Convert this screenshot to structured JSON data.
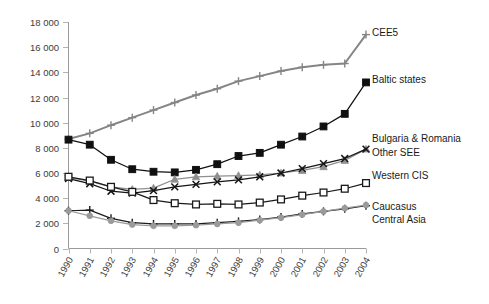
{
  "chart_data": {
    "type": "line",
    "title": "",
    "subtitle": "",
    "xlabel": "",
    "ylabel": "",
    "grid": false,
    "legend_position": "right-inline",
    "x": [
      1990,
      1991,
      1992,
      1993,
      1994,
      1995,
      1996,
      1997,
      1998,
      1999,
      2000,
      2001,
      2002,
      2003,
      2004
    ],
    "categories": [
      "1990",
      "1991",
      "1992",
      "1993",
      "1994",
      "1995",
      "1996",
      "1997",
      "1998",
      "1999",
      "2000",
      "2001",
      "2002",
      "2003",
      "2004"
    ],
    "ylim": [
      0,
      18000
    ],
    "yticks": [
      0,
      2000,
      4000,
      6000,
      8000,
      10000,
      12000,
      14000,
      16000,
      18000
    ],
    "ytick_labels": [
      "0",
      "2 000",
      "4 000",
      "6 000",
      "8 000",
      "10 000",
      "12 000",
      "14 000",
      "16 000",
      "18 000"
    ],
    "series": [
      {
        "name": "CEE5",
        "label": "CEE5",
        "color": "#858585",
        "marker": "plus",
        "values": [
          8700,
          9150,
          9800,
          10400,
          11000,
          11600,
          12200,
          12700,
          13300,
          13700,
          14100,
          14400,
          14600,
          14700,
          17000
        ]
      },
      {
        "name": "Baltic states",
        "label": "Baltic states",
        "color": "#101010",
        "marker": "square-filled",
        "values": [
          8650,
          8250,
          7050,
          6300,
          6100,
          6050,
          6250,
          6700,
          7350,
          7600,
          8250,
          8900,
          9700,
          10700,
          13200
        ]
      },
      {
        "name": "Bulgaria & Romania",
        "label": "Bulgaria & Romania",
        "color": "#8f8f8f",
        "marker": "triangle-filled",
        "values": [
          5650,
          5350,
          4900,
          4700,
          4800,
          5500,
          5700,
          5750,
          5800,
          5850,
          6000,
          6200,
          6500,
          7000,
          7900
        ]
      },
      {
        "name": "Other SEE",
        "label": "Other SEE",
        "color": "#151515",
        "marker": "cross",
        "values": [
          5550,
          5150,
          4550,
          4400,
          4600,
          4900,
          5100,
          5300,
          5450,
          5700,
          6000,
          6350,
          6750,
          7150,
          7900
        ]
      },
      {
        "name": "Western CIS",
        "label": "Western CIS",
        "color": "#1a1a1a",
        "marker": "square-open",
        "values": [
          5700,
          5400,
          4900,
          4500,
          3850,
          3600,
          3500,
          3550,
          3500,
          3650,
          3900,
          4200,
          4450,
          4750,
          5200
        ]
      },
      {
        "name": "Caucasus",
        "label": "Caucasus",
        "color": "#1c1c1c",
        "marker": "plus",
        "values": [
          3000,
          3050,
          2400,
          2050,
          1950,
          1950,
          1950,
          2050,
          2150,
          2300,
          2500,
          2750,
          2950,
          3150,
          3400
        ]
      },
      {
        "name": "Central Asia",
        "label": "Central Asia",
        "color": "#9a9a9a",
        "marker": "circle-filled",
        "values": [
          3000,
          2600,
          2200,
          1900,
          1800,
          1800,
          1850,
          1950,
          2050,
          2250,
          2450,
          2700,
          2950,
          3200,
          3450
        ]
      }
    ],
    "series_annotations": [
      {
        "label": "CEE5",
        "x": 372,
        "y": 33
      },
      {
        "label": "Baltic states",
        "x": 372,
        "y": 80
      },
      {
        "label": "Bulgaria & Romania",
        "x": 372,
        "y": 139
      },
      {
        "label": "Other SEE",
        "x": 372,
        "y": 153
      },
      {
        "label": "Western CIS",
        "x": 372,
        "y": 176
      },
      {
        "label": "Caucasus",
        "x": 372,
        "y": 207
      },
      {
        "label": "Central Asia",
        "x": 372,
        "y": 220
      }
    ]
  }
}
